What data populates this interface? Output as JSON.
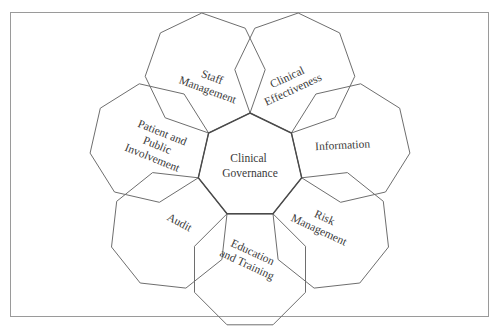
{
  "diagram": {
    "center": {
      "label_lines": [
        "Clinical",
        "Governance"
      ]
    },
    "petals": [
      {
        "id": "clinical-effectiveness",
        "label_lines": [
          "Clinical",
          "Effectiveness"
        ]
      },
      {
        "id": "information",
        "label_lines": [
          "Information"
        ]
      },
      {
        "id": "risk-management",
        "label_lines": [
          "Risk",
          "Management"
        ]
      },
      {
        "id": "education-and-training",
        "label_lines": [
          "Education",
          "and Training"
        ]
      },
      {
        "id": "audit",
        "label_lines": [
          "Audit"
        ]
      },
      {
        "id": "patient-and-public-involvement",
        "label_lines": [
          "Patient and",
          "Public",
          "Involvement"
        ]
      },
      {
        "id": "staff-management",
        "label_lines": [
          "Staff",
          "Management"
        ]
      }
    ],
    "colors": {
      "outline": "#6e6e6e",
      "center_outline": "#4a4a4a",
      "text": "#3a3a3a",
      "frame": "#9a9a9a"
    }
  }
}
